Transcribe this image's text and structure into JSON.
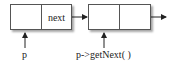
{
  "diagram": {
    "type": "linked-list",
    "nodes": [
      {
        "id": "node1",
        "cells": [
          "",
          "next"
        ]
      },
      {
        "id": "node2",
        "cells": [
          "",
          ""
        ]
      }
    ],
    "pointers": [
      {
        "label": "p",
        "target": "node1"
      },
      {
        "label": "p->getNext( )",
        "target": "node2"
      }
    ],
    "edges": [
      {
        "from": "node1.next",
        "to": "node2"
      },
      {
        "from": "node2.next",
        "to": "continuation"
      }
    ]
  }
}
